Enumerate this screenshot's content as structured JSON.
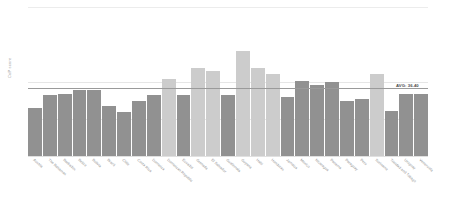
{
  "chart_data": {
    "type": "bar",
    "title": "",
    "xlabel": "",
    "ylabel": "CoP score",
    "ylim": [
      0,
      80
    ],
    "yticks": [
      0,
      20,
      40,
      80
    ],
    "grid": true,
    "legend": null,
    "average": 36.4,
    "average_label": "AVG: 36.40",
    "categories": [
      "Austria",
      "The Bahamas",
      "Barbados",
      "Belize",
      "Bolivia",
      "Brazil",
      "Chile",
      "Costa Rica",
      "Dominica",
      "Dominican Republic",
      "Ecuador",
      "Grenada",
      "El Salvador",
      "Guatemala",
      "Guyana",
      "Haiti",
      "Honduras",
      "Jamaica",
      "Mexico",
      "Nicaragua",
      "Panama",
      "Paraguay",
      "Peru",
      "Suriname",
      "Trinidad and Tobago",
      "Uruguay",
      "Venezuela"
    ],
    "values": [
      26.0,
      33.0,
      33.5,
      35.5,
      35.5,
      27.0,
      23.5,
      29.5,
      33.0,
      41.5,
      33.0,
      47.5,
      45.5,
      33.0,
      56.5,
      47.0,
      44.0,
      31.5,
      40.5,
      38.0,
      40.0,
      29.5,
      30.5,
      44.0,
      24.0,
      33.5,
      33.5
    ],
    "bar_shades": [
      "dark",
      "dark",
      "dark",
      "dark",
      "dark",
      "dark",
      "dark",
      "dark",
      "dark",
      "light",
      "dark",
      "light",
      "light",
      "dark",
      "light",
      "light",
      "light",
      "dark",
      "dark",
      "dark",
      "dark",
      "dark",
      "dark",
      "light",
      "dark",
      "dark",
      "dark"
    ],
    "colors": {
      "bar_dark": "#919191",
      "bar_light": "#cccccc",
      "grid": "#e6e6e6",
      "average_line": "#9a9a9a",
      "axis_text": "#9b9b9b"
    }
  }
}
